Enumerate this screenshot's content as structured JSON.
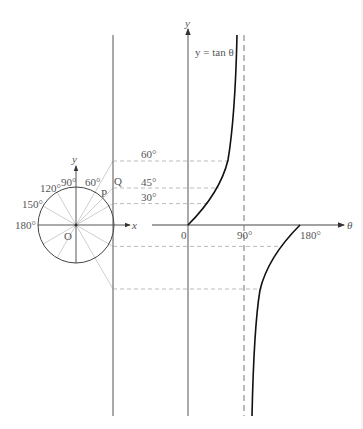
{
  "diagram": {
    "type": "unit-circle-tangent-construction",
    "curve_label": "y = tan θ",
    "unit_circle": {
      "center_label": "O",
      "axis_x_label": "x",
      "axis_y_label": "y",
      "point_on_circle_label": "P",
      "point_on_tangent_label": "Q",
      "angle_labels": [
        "90°",
        "60°",
        "120°",
        "150°",
        "180°"
      ]
    },
    "graph": {
      "x_axis_label": "θ",
      "y_axis_label": "y",
      "tick_labels": [
        "0",
        "90°",
        "180°"
      ],
      "projection_labels": [
        "60°",
        "45°",
        "30°"
      ]
    },
    "colors": {
      "curve": "#111111",
      "axis": "#555555",
      "guide": "#aaaaaa",
      "spoke": "#bbbbbb"
    }
  }
}
